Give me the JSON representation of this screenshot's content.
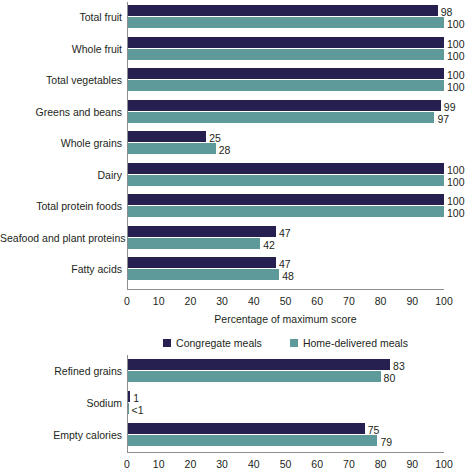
{
  "chart_data": [
    {
      "id": "top",
      "type": "bar",
      "orientation": "horizontal",
      "title": "",
      "xlabel": "Percentage of maximum score",
      "ylabel": "",
      "xlim": [
        0,
        100
      ],
      "xticks": [
        0,
        10,
        20,
        30,
        40,
        50,
        60,
        70,
        80,
        90,
        100
      ],
      "grid": false,
      "legend_position": "bottom",
      "categories": [
        "Total fruit",
        "Whole fruit",
        "Total vegetables",
        "Greens and beans",
        "Whole grains",
        "Dairy",
        "Total protein foods",
        "Seafood and plant proteins",
        "Fatty acids"
      ],
      "series": [
        {
          "name": "Congregate meals",
          "color": "#262050",
          "values": [
            98,
            100,
            100,
            99,
            25,
            100,
            100,
            47,
            47
          ],
          "labels": [
            "98",
            "100",
            "100",
            "99",
            "25",
            "100",
            "100",
            "47",
            "47"
          ]
        },
        {
          "name": "Home-delivered meals",
          "color": "#5f9a9a",
          "values": [
            100,
            100,
            100,
            97,
            28,
            100,
            100,
            42,
            48
          ],
          "labels": [
            "100",
            "100",
            "100",
            "97",
            "28",
            "100",
            "100",
            "42",
            "48"
          ]
        }
      ]
    },
    {
      "id": "bottom",
      "type": "bar",
      "orientation": "horizontal",
      "title": "",
      "xlabel": "",
      "ylabel": "",
      "xlim": [
        0,
        100
      ],
      "xticks": [
        0,
        10,
        20,
        30,
        40,
        50,
        60,
        70,
        80,
        90,
        100
      ],
      "grid": false,
      "legend_position": "none",
      "categories": [
        "Refined grains",
        "Sodium",
        "Empty calories"
      ],
      "series": [
        {
          "name": "Congregate meals",
          "color": "#262050",
          "values": [
            83,
            1,
            75
          ],
          "labels": [
            "83",
            "1",
            "75"
          ]
        },
        {
          "name": "Home-delivered meals",
          "color": "#5f9a9a",
          "values": [
            80,
            0.4,
            79
          ],
          "labels": [
            "80",
            "<1",
            "79"
          ]
        }
      ]
    }
  ],
  "legend": {
    "items": [
      {
        "label": "Congregate meals",
        "color": "#262050"
      },
      {
        "label": "Home-delivered meals",
        "color": "#5f9a9a"
      }
    ]
  },
  "colors": {
    "congregate": "#262050",
    "home_delivered": "#5f9a9a",
    "axis": "#8c8f91",
    "text": "#231f20",
    "background": "#ffffff"
  }
}
